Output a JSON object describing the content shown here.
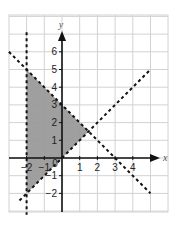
{
  "chart_data": {
    "type": "line",
    "title": "",
    "xlabel": "x",
    "ylabel": "y",
    "xlim": [
      -3,
      5.9
    ],
    "ylim": [
      -3,
      8
    ],
    "grid": true,
    "x_ticks": [
      -2,
      -1,
      1,
      2,
      3,
      4
    ],
    "x_tick_labels": [
      "−2",
      "−1",
      "1",
      "2",
      "3",
      "4"
    ],
    "y_ticks": [
      -2,
      -1,
      1,
      2,
      3,
      4,
      5,
      6
    ],
    "y_tick_labels": [
      "−2",
      "−1",
      "1",
      "2",
      "3",
      "4",
      "5",
      "6"
    ],
    "origin_label": "0",
    "series": [
      {
        "name": "x = -2",
        "style": "dashed",
        "points": [
          [
            -2,
            7.1
          ],
          [
            -2,
            -3.2
          ]
        ]
      },
      {
        "name": "y = -x + 3",
        "style": "dashed",
        "points": [
          [
            -3,
            6
          ],
          [
            5,
            -2
          ]
        ]
      },
      {
        "name": "y = x",
        "style": "dashed",
        "points": [
          [
            -2.4,
            -2.4
          ],
          [
            5,
            5
          ]
        ]
      }
    ],
    "shaded_region": {
      "description": "x > -2, y < -x + 3, y > x",
      "vertices": [
        [
          -2,
          5
        ],
        [
          1.5,
          1.5
        ],
        [
          -2,
          -2
        ]
      ],
      "color": "#9a9a9a"
    },
    "colors": {
      "grid": "#d2d2d2",
      "axis": "#111111",
      "dashed_line": "#111111",
      "shade": "#9a9a9a"
    }
  }
}
